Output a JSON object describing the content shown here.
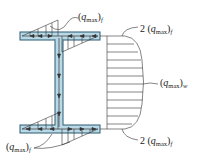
{
  "figure": {
    "colors": {
      "section_fill": "#b9d9e6",
      "section_stroke": "#2a5a70",
      "line": "#333333"
    },
    "labels": {
      "top_flange_max": {
        "prefix": "",
        "var": "q",
        "sub": "max",
        "suffix": "f",
        "text": "(q_max)_f"
      },
      "top_right_junction": {
        "prefix": "2 ",
        "var": "q",
        "sub": "max",
        "suffix": "f",
        "text": "2 (q_max)_f"
      },
      "web_max": {
        "prefix": "",
        "var": "q",
        "sub": "max",
        "suffix": "w",
        "text": "(q_max)_w"
      },
      "bottom_right_junction": {
        "prefix": "2 ",
        "var": "q",
        "sub": "max",
        "suffix": "f",
        "text": "2 (q_max)_f"
      },
      "bottom_flange_max": {
        "prefix": "",
        "var": "q",
        "sub": "max",
        "suffix": "f",
        "text": "(q_max)_f"
      }
    }
  }
}
